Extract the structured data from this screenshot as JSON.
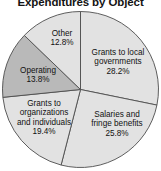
{
  "chart_data": {
    "type": "pie",
    "title": "Expenditures by Object",
    "xlabel": "",
    "ylabel": "",
    "legend": "none",
    "grid": false,
    "start_angle_deg": 0,
    "direction": "clockwise",
    "categories": [
      "Grants to local governments",
      "Salaries and fringe benefits",
      "Grants to organizations and individuals",
      "Operating",
      "Other"
    ],
    "values": [
      28.2,
      25.8,
      19.4,
      13.8,
      12.8
    ],
    "value_unit": "%",
    "colors": [
      "#e2e2e2",
      "#e2e2e2",
      "#e2e2e2",
      "#b9b9b9",
      "#e2e2e2"
    ],
    "slice_border_color": "#4d4d4d",
    "background": "#ffffff",
    "slices": [
      {
        "label": "Grants to local governments",
        "label_line1": "Grants to local",
        "label_line2": "governments",
        "value": 28.2,
        "value_text": "28.2%",
        "color": "#e2e2e2"
      },
      {
        "label": "Salaries and fringe benefits",
        "label_line1": "Salaries and",
        "label_line2": "fringe benefits",
        "value": 25.8,
        "value_text": "25.8%",
        "color": "#e2e2e2"
      },
      {
        "label": "Grants to organizations and individuals",
        "label_line1": "Grants to",
        "label_line2": "organizations",
        "label_line3": "and individuals",
        "value": 19.4,
        "value_text": "19.4%",
        "color": "#e2e2e2"
      },
      {
        "label": "Operating",
        "label_line1": "Operating",
        "value": 13.8,
        "value_text": "13.8%",
        "color": "#b9b9b9"
      },
      {
        "label": "Other",
        "label_line1": "Other",
        "value": 12.8,
        "value_text": "12.8%",
        "color": "#e2e2e2"
      }
    ]
  }
}
